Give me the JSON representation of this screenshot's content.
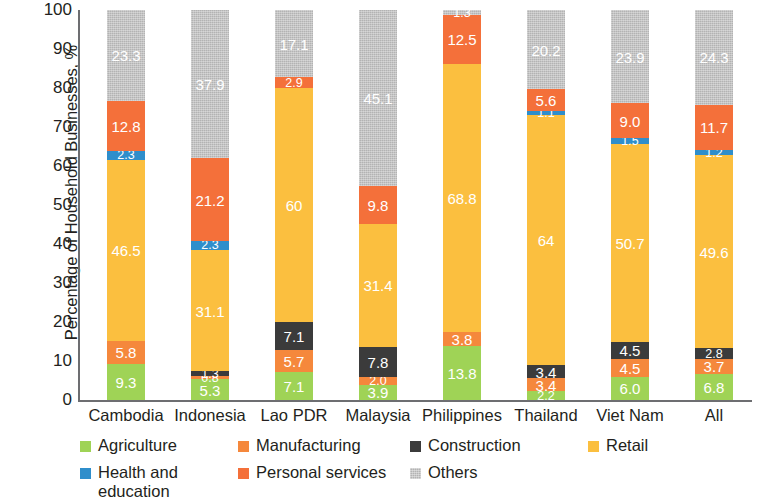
{
  "chart_data": {
    "type": "bar",
    "subtype": "stacked-bar-100",
    "title": "",
    "xlabel": "",
    "ylabel": "Percentage of Household Businesses, %",
    "ylim": [
      0,
      100
    ],
    "yticks": [
      0,
      10,
      20,
      30,
      40,
      50,
      60,
      70,
      80,
      90,
      100
    ],
    "ytick_labels": [
      "0",
      "10",
      "20",
      "30",
      "40",
      "50",
      "60",
      "70",
      "80",
      "90",
      "100"
    ],
    "grid": false,
    "legend_position": "bottom",
    "categories": [
      "Cambodia",
      "Indonesia",
      "Lao PDR",
      "Malaysia",
      "Philippines",
      "Thailand",
      "Viet Nam",
      "All"
    ],
    "series": [
      {
        "name": "Agriculture",
        "color": "#9fd356",
        "values": [
          9.3,
          5.3,
          7.1,
          3.9,
          13.8,
          2.2,
          6.0,
          6.8
        ],
        "labels": [
          "9.3",
          "5.3",
          "7.1",
          "3.9",
          "13.8",
          "2.2",
          "6.0",
          "6.8"
        ]
      },
      {
        "name": "Manufacturing",
        "color": "#f5883c",
        "values": [
          5.8,
          0.8,
          5.7,
          2.0,
          3.8,
          3.4,
          4.5,
          3.7
        ],
        "labels": [
          "5.8",
          "0.8",
          "5.7",
          "2.0",
          "3.8",
          "3.4",
          "4.5",
          "3.7"
        ]
      },
      {
        "name": "Construction",
        "color": "#3b3b3b",
        "values": [
          0.0,
          1.3,
          7.1,
          7.8,
          0.0,
          3.4,
          4.5,
          2.8
        ],
        "labels": [
          "",
          "1.3",
          "7.1",
          "7.8",
          "",
          "3.4",
          "4.5",
          "2.8"
        ]
      },
      {
        "name": "Retail",
        "color": "#fbbf3f",
        "values": [
          46.5,
          31.1,
          60.0,
          31.4,
          68.8,
          64.0,
          50.7,
          49.6
        ],
        "labels": [
          "46.5",
          "31.1",
          "60",
          "31.4",
          "68.8",
          "64",
          "50.7",
          "49.6"
        ]
      },
      {
        "name": "Health and education",
        "color": "#2f8ecb",
        "values": [
          2.3,
          2.3,
          0.0,
          0.0,
          0.0,
          1.1,
          1.5,
          1.2
        ],
        "labels": [
          "2.3",
          "2.3",
          "",
          "",
          "",
          "1.1",
          "1.5",
          "1.2"
        ]
      },
      {
        "name": "Personal services",
        "color": "#f4703a",
        "values": [
          12.8,
          21.2,
          2.9,
          9.8,
          12.5,
          5.6,
          9.0,
          11.7
        ],
        "labels": [
          "12.8",
          "21.2",
          "2.9",
          "9.8",
          "12.5",
          "5.6",
          "9.0",
          "11.7"
        ]
      },
      {
        "name": "Others",
        "color": "#b3b3b3",
        "values": [
          23.3,
          37.9,
          17.1,
          45.1,
          1.3,
          20.2,
          23.9,
          24.3
        ],
        "labels": [
          "23.3",
          "37.9",
          "17.1",
          "45.1",
          "1.3",
          "20.2",
          "23.9",
          "24.3"
        ]
      }
    ],
    "legend": [
      {
        "label": "Agriculture",
        "color": "#9fd356",
        "textured": false
      },
      {
        "label": "Manufacturing",
        "color": "#f5883c",
        "textured": false
      },
      {
        "label": "Construction",
        "color": "#3b3b3b",
        "textured": false
      },
      {
        "label": "Retail",
        "color": "#fbbf3f",
        "textured": false
      },
      {
        "label": "Health and education",
        "color": "#2f8ecb",
        "textured": false
      },
      {
        "label": "Personal services",
        "color": "#f4703a",
        "textured": false
      },
      {
        "label": "Others",
        "color": "#b3b3b3",
        "textured": true
      }
    ]
  }
}
